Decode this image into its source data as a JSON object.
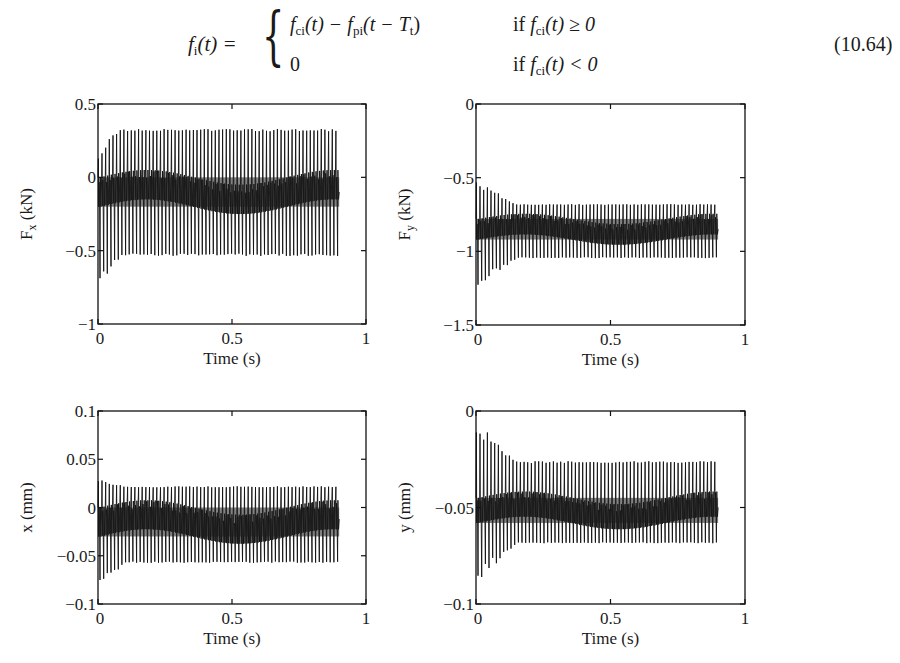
{
  "equation": {
    "lhs_f": "f",
    "lhs_sub": "i",
    "lhs_arg": "(t) =",
    "case1_expr_f1": "f",
    "case1_expr_sub1": "ci",
    "case1_expr_mid": "(t) − ",
    "case1_expr_f2": "f",
    "case1_expr_sub2": "pi",
    "case1_expr_arg": "(t − T",
    "case1_expr_T_sub": "t",
    "case1_expr_close": ")",
    "case1_cond_if": "if ",
    "case1_cond_f": "f",
    "case1_cond_sub": "ci",
    "case1_cond_rest": "(t) ≥ 0",
    "case2_value": "0",
    "case2_cond_if": "if ",
    "case2_cond_f": "f",
    "case2_cond_sub": "ci",
    "case2_cond_rest": "(t) < 0",
    "number": "(10.64)"
  },
  "chart_data": [
    {
      "id": "fx",
      "type": "line",
      "title": "",
      "xlabel": "Time (s)",
      "ylabel": "F",
      "ylabel_sub": "x",
      "ylabel_unit": " (kN)",
      "xlim": [
        0,
        1
      ],
      "ylim": [
        -1,
        0.5
      ],
      "xticks": [
        0,
        0.5,
        1
      ],
      "xtick_labels": [
        "0",
        "0.5",
        "1"
      ],
      "yticks": [
        -1,
        -0.5,
        0,
        0.5
      ],
      "ytick_labels": [
        "−1",
        "−0.5",
        "0",
        "0.5"
      ],
      "grid": false,
      "signal": {
        "t_end": 0.9,
        "cycles": 66,
        "mean": -0.1,
        "steady_max": 0.33,
        "steady_min": -0.52,
        "band_hi": 0.0,
        "band_lo": -0.2,
        "transient_min": -0.72,
        "transient_max": 0.12,
        "transient_dur": 0.08
      }
    },
    {
      "id": "fy",
      "type": "line",
      "title": "",
      "xlabel": "Time (s)",
      "ylabel": "F",
      "ylabel_sub": "y",
      "ylabel_unit": " (kN)",
      "xlim": [
        0,
        1
      ],
      "ylim": [
        -1.5,
        0
      ],
      "xticks": [
        0,
        0.5,
        1
      ],
      "xtick_labels": [
        "0",
        "0.5",
        "1"
      ],
      "yticks": [
        -1.5,
        -1,
        -0.5,
        0
      ],
      "ytick_labels": [
        "−1.5",
        "−1",
        "−0.5",
        "0"
      ],
      "grid": false,
      "signal": {
        "t_end": 0.9,
        "cycles": 66,
        "mean": -0.85,
        "steady_max": -0.68,
        "steady_min": -1.04,
        "band_hi": -0.78,
        "band_lo": -0.92,
        "transient_min": -1.23,
        "transient_max": -0.5,
        "transient_dur": 0.15
      }
    },
    {
      "id": "x",
      "type": "line",
      "title": "",
      "xlabel": "Time (s)",
      "ylabel": "x (mm)",
      "ylabel_sub": "",
      "ylabel_unit": "",
      "xlim": [
        0,
        1
      ],
      "ylim": [
        -0.1,
        0.1
      ],
      "xticks": [
        0,
        0.5,
        1
      ],
      "xtick_labels": [
        "0",
        "0.5",
        "1"
      ],
      "yticks": [
        -0.1,
        -0.05,
        0,
        0.05,
        0.1
      ],
      "ytick_labels": [
        "−0.1",
        "−0.05",
        "0",
        "0.05",
        "0.1"
      ],
      "grid": false,
      "signal": {
        "t_end": 0.9,
        "cycles": 66,
        "mean": -0.012,
        "steady_max": 0.022,
        "steady_min": -0.056,
        "band_hi": 0.0,
        "band_lo": -0.03,
        "transient_min": -0.082,
        "transient_max": 0.03,
        "transient_dur": 0.1
      }
    },
    {
      "id": "y",
      "type": "line",
      "title": "",
      "xlabel": "Time (s)",
      "ylabel": "y (mm)",
      "ylabel_sub": "",
      "ylabel_unit": "",
      "xlim": [
        0,
        1
      ],
      "ylim": [
        -0.1,
        0
      ],
      "xticks": [
        0,
        0.5,
        1
      ],
      "xtick_labels": [
        "0",
        "0.5",
        "1"
      ],
      "yticks": [
        -0.1,
        -0.05,
        0
      ],
      "ytick_labels": [
        "−0.1",
        "−0.05",
        "0"
      ],
      "grid": false,
      "signal": {
        "t_end": 0.9,
        "cycles": 66,
        "mean": -0.05,
        "steady_max": -0.026,
        "steady_min": -0.068,
        "band_hi": -0.045,
        "band_lo": -0.058,
        "transient_min": -0.088,
        "transient_max": -0.004,
        "transient_dur": 0.15
      }
    }
  ]
}
